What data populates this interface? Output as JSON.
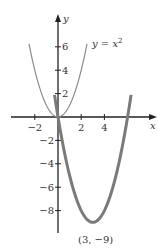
{
  "chart_data": {
    "type": "line",
    "title": "",
    "xlabel": "x",
    "ylabel": "y",
    "xlim": [
      -4,
      8.5
    ],
    "ylim": [
      -10,
      9
    ],
    "x_ticks": [
      -2,
      2,
      4
    ],
    "x_tick_labels": [
      "−2",
      "2",
      "4"
    ],
    "y_ticks": [
      6,
      4,
      2,
      -2,
      -4,
      -6,
      -8
    ],
    "y_tick_labels": [
      "6",
      "4",
      "2",
      "−2",
      "−4",
      "−6",
      "−8"
    ],
    "grid": false,
    "legend": null,
    "series": [
      {
        "name": "y = x²",
        "expression": "x^2",
        "x_range": [
          -2.5,
          2.5
        ],
        "style": "thin",
        "color": "#8a8a8a",
        "label": "y = x",
        "label_superscript": "2"
      },
      {
        "name": "y = x² − 6x",
        "expression": "x^2 - 6x",
        "x_range": [
          -0.3,
          6.3
        ],
        "style": "thick",
        "color": "#7a7a7a"
      }
    ],
    "annotations": [
      {
        "text": "(3, −9)",
        "x": 3,
        "y": -9,
        "position": "below"
      }
    ]
  }
}
